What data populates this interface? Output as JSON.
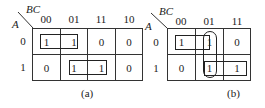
{
  "maps": [
    {
      "id": "a",
      "caption": "(a)",
      "row_var": "A",
      "col_var": "BC",
      "col_labels": [
        "00",
        "01",
        "11",
        "10"
      ],
      "row_labels": [
        "0",
        "1"
      ],
      "cells": [
        [
          "1",
          "1",
          "0",
          "0"
        ],
        [
          "0",
          "1",
          "1",
          "0"
        ]
      ],
      "groups": [
        {
          "cells": [
            [
              0,
              0
            ],
            [
              0,
              1
            ]
          ],
          "shape": "rectangle"
        },
        {
          "cells": [
            [
              1,
              1
            ],
            [
              1,
              2
            ]
          ],
          "shape": "rectangle"
        }
      ]
    },
    {
      "id": "b",
      "caption": "(b)",
      "row_var": "A",
      "col_var": "BC",
      "col_labels": [
        "00",
        "01",
        "11"
      ],
      "row_labels": [
        "0",
        "1"
      ],
      "cells": [
        [
          "1",
          "1",
          "0"
        ],
        [
          "0",
          "1",
          "1"
        ]
      ],
      "groups": [
        {
          "cells": [
            [
              0,
              0
            ],
            [
              0,
              1
            ]
          ],
          "shape": "rectangle"
        },
        {
          "cells": [
            [
              1,
              1
            ],
            [
              1,
              2
            ]
          ],
          "shape": "rectangle"
        },
        {
          "cells": [
            [
              0,
              1
            ],
            [
              1,
              1
            ]
          ],
          "shape": "rounded-vertical"
        }
      ]
    }
  ]
}
